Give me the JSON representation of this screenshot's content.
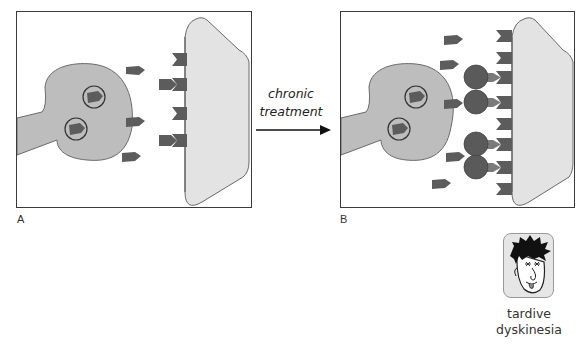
{
  "panels": [
    {
      "id": "A",
      "label": "A",
      "receptor_count": 4,
      "blocked_receptors": 0,
      "free_dopamine": 3
    },
    {
      "id": "B",
      "label": "B",
      "receptor_count": 8,
      "blocked_receptors": 4,
      "free_dopamine": 5
    }
  ],
  "transition": {
    "line1": "chronic",
    "line2": "treatment"
  },
  "outcome": {
    "icon": "face-icon",
    "line1": "tardive",
    "line2": "dyskinesia"
  },
  "colors": {
    "neuron_fill": "#bdbdbd",
    "postsynaptic_fill": "#e3e3e3",
    "molecule_fill": "#5c5c5c",
    "outline": "#555555",
    "face_bg": "#e6e6e6"
  }
}
